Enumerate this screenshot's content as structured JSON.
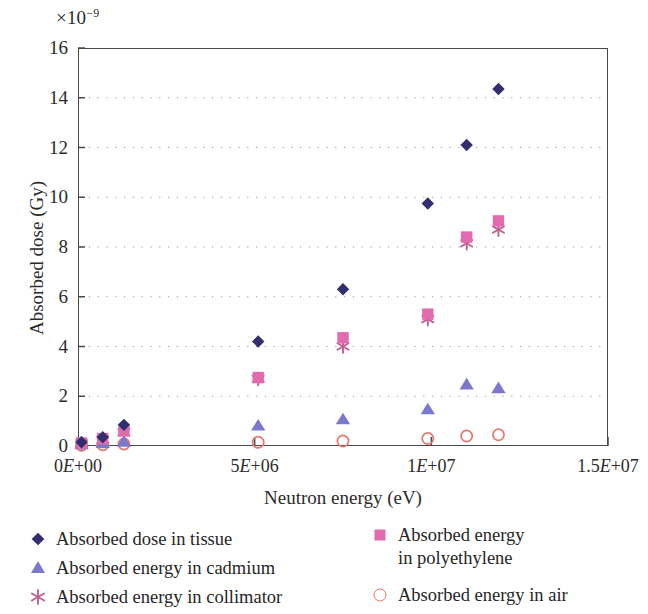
{
  "chart_data": {
    "type": "scatter",
    "title": "",
    "xlabel": "Neutron energy (eV)",
    "ylabel": "Absorbed dose (Gy)",
    "y_multiplier": "×10⁻⁹",
    "y_multiplier_base": "×10",
    "y_multiplier_exp": "−9",
    "xlim": [
      0,
      15000000
    ],
    "ylim": [
      0,
      16
    ],
    "grid": "horizontal-dotted",
    "legend_position": "below",
    "xticks": [
      {
        "value": 0,
        "label_num": "0",
        "label_e": "E",
        "label_exp": "+00",
        "label": "0E+00"
      },
      {
        "value": 5000000,
        "label_num": "5",
        "label_e": "E",
        "label_exp": "+06",
        "label": "5E+06"
      },
      {
        "value": 10000000,
        "label_num": "1",
        "label_e": "E",
        "label_exp": "+07",
        "label": "1E+07"
      },
      {
        "value": 15000000,
        "label_num": "1.5",
        "label_e": "E",
        "label_exp": "+07",
        "label": "1.5E+07"
      }
    ],
    "yticks": [
      0,
      2,
      4,
      6,
      8,
      10,
      12,
      14,
      16
    ],
    "ytick_labels": [
      "0",
      "2",
      "4",
      "6",
      "8",
      "10",
      "12",
      "14",
      "16"
    ],
    "series": [
      {
        "name": "Absorbed dose in tissue",
        "marker": "diamond",
        "color": "#312f6e",
        "x": [
          100000,
          700000,
          1300000,
          5100000,
          7500000,
          9900000,
          11000000,
          11900000
        ],
        "y": [
          0.15,
          0.35,
          0.85,
          4.2,
          6.3,
          9.75,
          12.1,
          14.35
        ]
      },
      {
        "name": "Absorbed energy\nin polyethylene",
        "marker": "square",
        "color": "#e26bb0",
        "x": [
          100000,
          700000,
          1300000,
          5100000,
          7500000,
          9900000,
          11000000,
          11900000
        ],
        "y": [
          0.12,
          0.3,
          0.6,
          2.75,
          4.35,
          5.3,
          8.4,
          9.05
        ]
      },
      {
        "name": "Absorbed energy in cadmium",
        "marker": "triangle",
        "color": "#7b79cd",
        "x": [
          100000,
          700000,
          1300000,
          5100000,
          7500000,
          9900000,
          11000000,
          11900000
        ],
        "y": [
          0.05,
          0.1,
          0.15,
          0.8,
          1.05,
          1.45,
          2.45,
          2.3
        ]
      },
      {
        "name": "Absorbed energy in collimator",
        "marker": "cross",
        "color": "#c2608f",
        "x": [
          100000,
          700000,
          1300000,
          5100000,
          7500000,
          9900000,
          11000000,
          11900000
        ],
        "y": [
          0.1,
          0.25,
          0.55,
          2.7,
          4.0,
          5.1,
          8.15,
          8.7
        ]
      },
      {
        "name": "Absorbed energy in air",
        "marker": "circle",
        "color": "#e8756b",
        "x": [
          100000,
          700000,
          1300000,
          5100000,
          7500000,
          9900000,
          11000000,
          11900000
        ],
        "y": [
          0.03,
          0.05,
          0.08,
          0.15,
          0.2,
          0.3,
          0.4,
          0.45
        ]
      }
    ]
  },
  "legend": {
    "left_column": [
      {
        "label": "Absorbed dose in tissue",
        "marker": "diamond"
      },
      {
        "label": "Absorbed energy in cadmium",
        "marker": "triangle"
      },
      {
        "label": "Absorbed energy in collimator",
        "marker": "cross"
      }
    ],
    "right_column": [
      {
        "label": "Absorbed energy\nin polyethylene",
        "marker": "square"
      },
      {
        "label": "Absorbed energy in air",
        "marker": "circle"
      }
    ]
  }
}
